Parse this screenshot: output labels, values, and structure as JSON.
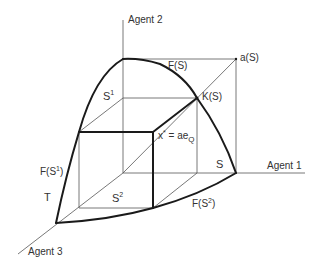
{
  "figure": {
    "type": "3-agent bargaining diagram",
    "axes": {
      "agent1": "Agent 1",
      "agent2": "Agent 2",
      "agent3": "Agent 3"
    },
    "labels": {
      "FS": "F(S)",
      "aS": "a(S)",
      "KS": "K(S)",
      "S1_base": "S",
      "S1_sup": "1",
      "S2_base": "S",
      "S2_sup": "2",
      "S": "S",
      "T": "T",
      "FS1_pre": "F(S",
      "FS1_sup": "1",
      "FS1_post": ")",
      "FS2_pre": "F(S",
      "FS2_sup": "2",
      "FS2_post": ")",
      "xstar_pre": "x",
      "xstar_sup": "*",
      "xstar_mid": " = ae",
      "xstar_sub": "Q"
    },
    "colors": {
      "line": "#1a1a1a",
      "thin_line": "#555555",
      "text": "#333333",
      "background": "#ffffff"
    }
  }
}
